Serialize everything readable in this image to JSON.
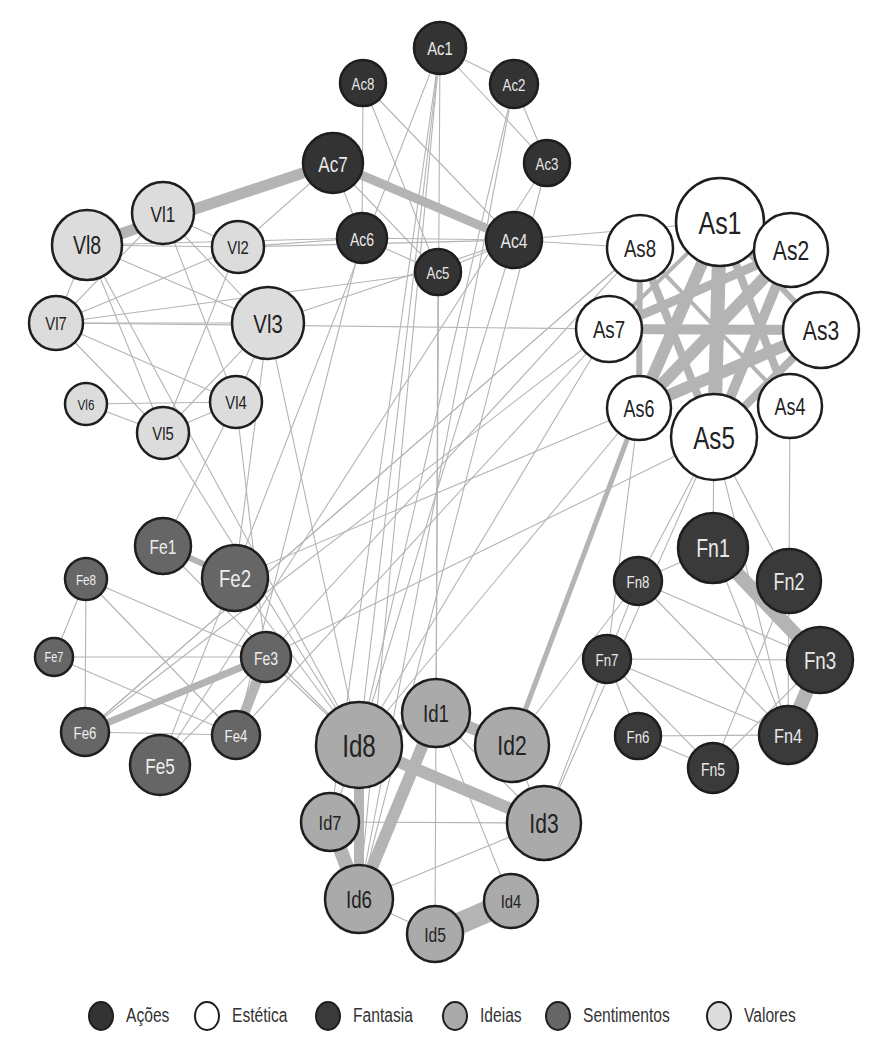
{
  "categories": {
    "Ac": {
      "label": "Ações",
      "fill": "#333333",
      "text": "#e8e8e8"
    },
    "As": {
      "label": "Estética",
      "fill": "#ffffff",
      "text": "#222222"
    },
    "Fn": {
      "label": "Fantasia",
      "fill": "#3a3a3a",
      "text": "#e8e8e8"
    },
    "Id": {
      "label": "Ideias",
      "fill": "#aaaaaa",
      "text": "#222222"
    },
    "Fe": {
      "label": "Sentimentos",
      "fill": "#666666",
      "text": "#eeeeee"
    },
    "Vl": {
      "label": "Valores",
      "fill": "#dcdcdc",
      "text": "#222222"
    }
  },
  "legend": [
    {
      "cat": "Ac",
      "label": "Ações"
    },
    {
      "cat": "As",
      "label": "Estética"
    },
    {
      "cat": "Fn",
      "label": "Fantasia"
    },
    {
      "cat": "Id",
      "label": "Ideias"
    },
    {
      "cat": "Fe",
      "label": "Sentimentos"
    },
    {
      "cat": "Vl",
      "label": "Valores"
    }
  ],
  "nodes": [
    {
      "id": "Ac1",
      "label": "Ac1",
      "cat": "Ac",
      "x": 440,
      "y": 48,
      "r": 26
    },
    {
      "id": "Ac2",
      "label": "Ac2",
      "cat": "Ac",
      "x": 514,
      "y": 84,
      "r": 24
    },
    {
      "id": "Ac3",
      "label": "Ac3",
      "cat": "Ac",
      "x": 547,
      "y": 163,
      "r": 23
    },
    {
      "id": "Ac4",
      "label": "Ac4",
      "cat": "Ac",
      "x": 514,
      "y": 240,
      "r": 28
    },
    {
      "id": "Ac5",
      "label": "Ac5",
      "cat": "Ac",
      "x": 438,
      "y": 272,
      "r": 23
    },
    {
      "id": "Ac6",
      "label": "Ac6",
      "cat": "Ac",
      "x": 362,
      "y": 238,
      "r": 25
    },
    {
      "id": "Ac7",
      "label": "Ac7",
      "cat": "Ac",
      "x": 333,
      "y": 163,
      "r": 30
    },
    {
      "id": "Ac8",
      "label": "Ac8",
      "cat": "Ac",
      "x": 363,
      "y": 83,
      "r": 23
    },
    {
      "id": "As1",
      "label": "As1",
      "cat": "As",
      "x": 720,
      "y": 222,
      "r": 44
    },
    {
      "id": "As2",
      "label": "As2",
      "cat": "As",
      "x": 791,
      "y": 250,
      "r": 37
    },
    {
      "id": "As3",
      "label": "As3",
      "cat": "As",
      "x": 821,
      "y": 330,
      "r": 38
    },
    {
      "id": "As4",
      "label": "As4",
      "cat": "As",
      "x": 790,
      "y": 406,
      "r": 32
    },
    {
      "id": "As5",
      "label": "As5",
      "cat": "As",
      "x": 714,
      "y": 437,
      "r": 43
    },
    {
      "id": "As6",
      "label": "As6",
      "cat": "As",
      "x": 639,
      "y": 408,
      "r": 32
    },
    {
      "id": "As7",
      "label": "As7",
      "cat": "As",
      "x": 609,
      "y": 329,
      "r": 33
    },
    {
      "id": "As8",
      "label": "As8",
      "cat": "As",
      "x": 640,
      "y": 248,
      "r": 33
    },
    {
      "id": "Fn1",
      "label": "Fn1",
      "cat": "Fn",
      "x": 713,
      "y": 548,
      "r": 35
    },
    {
      "id": "Fn2",
      "label": "Fn2",
      "cat": "Fn",
      "x": 789,
      "y": 581,
      "r": 32
    },
    {
      "id": "Fn3",
      "label": "Fn3",
      "cat": "Fn",
      "x": 820,
      "y": 660,
      "r": 33
    },
    {
      "id": "Fn4",
      "label": "Fn4",
      "cat": "Fn",
      "x": 788,
      "y": 735,
      "r": 29
    },
    {
      "id": "Fn5",
      "label": "Fn5",
      "cat": "Fn",
      "x": 713,
      "y": 768,
      "r": 25
    },
    {
      "id": "Fn6",
      "label": "Fn6",
      "cat": "Fn",
      "x": 638,
      "y": 736,
      "r": 23
    },
    {
      "id": "Fn7",
      "label": "Fn7",
      "cat": "Fn",
      "x": 607,
      "y": 659,
      "r": 24
    },
    {
      "id": "Fn8",
      "label": "Fn8",
      "cat": "Fn",
      "x": 638,
      "y": 581,
      "r": 24
    },
    {
      "id": "Id1",
      "label": "Id1",
      "cat": "Id",
      "x": 436,
      "y": 713,
      "r": 34
    },
    {
      "id": "Id2",
      "label": "Id2",
      "cat": "Id",
      "x": 512,
      "y": 745,
      "r": 37
    },
    {
      "id": "Id3",
      "label": "Id3",
      "cat": "Id",
      "x": 544,
      "y": 823,
      "r": 37
    },
    {
      "id": "Id4",
      "label": "Id4",
      "cat": "Id",
      "x": 511,
      "y": 901,
      "r": 27
    },
    {
      "id": "Id5",
      "label": "Id5",
      "cat": "Id",
      "x": 435,
      "y": 934,
      "r": 28
    },
    {
      "id": "Id6",
      "label": "Id6",
      "cat": "Id",
      "x": 359,
      "y": 899,
      "r": 34
    },
    {
      "id": "Id7",
      "label": "Id7",
      "cat": "Id",
      "x": 330,
      "y": 822,
      "r": 29
    },
    {
      "id": "Id8",
      "label": "Id8",
      "cat": "Id",
      "x": 359,
      "y": 745,
      "r": 43
    },
    {
      "id": "Fe1",
      "label": "Fe1",
      "cat": "Fe",
      "x": 163,
      "y": 546,
      "r": 28
    },
    {
      "id": "Fe2",
      "label": "Fe2",
      "cat": "Fe",
      "x": 235,
      "y": 578,
      "r": 33
    },
    {
      "id": "Fe3",
      "label": "Fe3",
      "cat": "Fe",
      "x": 266,
      "y": 657,
      "r": 25
    },
    {
      "id": "Fe4",
      "label": "Fe4",
      "cat": "Fe",
      "x": 236,
      "y": 735,
      "r": 24
    },
    {
      "id": "Fe5",
      "label": "Fe5",
      "cat": "Fe",
      "x": 160,
      "y": 765,
      "r": 30
    },
    {
      "id": "Fe6",
      "label": "Fe6",
      "cat": "Fe",
      "x": 85,
      "y": 732,
      "r": 24
    },
    {
      "id": "Fe7",
      "label": "Fe7",
      "cat": "Fe",
      "x": 54,
      "y": 657,
      "r": 19
    },
    {
      "id": "Fe8",
      "label": "Fe8",
      "cat": "Fe",
      "x": 86,
      "y": 579,
      "r": 21
    },
    {
      "id": "Vl1",
      "label": "Vl1",
      "cat": "Vl",
      "x": 163,
      "y": 213,
      "r": 31
    },
    {
      "id": "Vl2",
      "label": "Vl2",
      "cat": "Vl",
      "x": 238,
      "y": 247,
      "r": 26
    },
    {
      "id": "Vl3",
      "label": "Vl3",
      "cat": "Vl",
      "x": 268,
      "y": 323,
      "r": 36
    },
    {
      "id": "Vl4",
      "label": "Vl4",
      "cat": "Vl",
      "x": 236,
      "y": 402,
      "r": 26
    },
    {
      "id": "Vl5",
      "label": "Vl5",
      "cat": "Vl",
      "x": 163,
      "y": 433,
      "r": 26
    },
    {
      "id": "Vl6",
      "label": "Vl6",
      "cat": "Vl",
      "x": 86,
      "y": 404,
      "r": 21
    },
    {
      "id": "Vl7",
      "label": "Vl7",
      "cat": "Vl",
      "x": 56,
      "y": 323,
      "r": 27
    },
    {
      "id": "Vl8",
      "label": "Vl8",
      "cat": "Vl",
      "x": 87,
      "y": 245,
      "r": 35
    }
  ],
  "edges": [
    [
      "Ac7",
      "Vl8",
      11
    ],
    [
      "Ac7",
      "Ac4",
      9
    ],
    [
      "Ac1",
      "Ac2",
      1
    ],
    [
      "Ac1",
      "Ac3",
      1
    ],
    [
      "Ac2",
      "Ac3",
      1
    ],
    [
      "Ac8",
      "Ac6",
      1
    ],
    [
      "Ac8",
      "Ac5",
      1
    ],
    [
      "Ac8",
      "Ac4",
      1
    ],
    [
      "Ac7",
      "Ac6",
      1
    ],
    [
      "Ac7",
      "Ac5",
      1
    ],
    [
      "Ac6",
      "Ac4",
      1
    ],
    [
      "Ac6",
      "Ac5",
      1
    ],
    [
      "Ac5",
      "Ac4",
      1
    ],
    [
      "Ac4",
      "As1",
      1
    ],
    [
      "Ac4",
      "As8",
      1
    ],
    [
      "Ac6",
      "Vl2",
      1
    ],
    [
      "Ac6",
      "Vl8",
      1
    ],
    [
      "Ac4",
      "Vl2",
      1
    ],
    [
      "Ac7",
      "Vl2",
      1
    ],
    [
      "Ac5",
      "Vl7",
      1
    ],
    [
      "Ac1",
      "Id8",
      1
    ],
    [
      "Ac1",
      "Id6",
      1
    ],
    [
      "Ac1",
      "Id1",
      1
    ],
    [
      "Ac2",
      "Id8",
      1
    ],
    [
      "Ac2",
      "Id6",
      1
    ],
    [
      "Ac3",
      "Id6",
      1
    ],
    [
      "Ac5",
      "Id1",
      1
    ],
    [
      "Ac4",
      "Id8",
      1
    ],
    [
      "Ac1",
      "Id7",
      1
    ],
    [
      "Ac3",
      "Fe5",
      1
    ],
    [
      "Vl1",
      "Vl2",
      1
    ],
    [
      "Vl1",
      "Vl3",
      1
    ],
    [
      "Vl1",
      "Vl4",
      1
    ],
    [
      "Vl1",
      "Vl7",
      1
    ],
    [
      "Vl8",
      "Vl7",
      1
    ],
    [
      "Vl8",
      "Vl2",
      1
    ],
    [
      "Vl8",
      "Vl3",
      1
    ],
    [
      "Vl8",
      "Vl5",
      1
    ],
    [
      "Vl7",
      "Vl2",
      1
    ],
    [
      "Vl7",
      "Vl3",
      1
    ],
    [
      "Vl7",
      "Vl4",
      1
    ],
    [
      "Vl7",
      "Vl5",
      1
    ],
    [
      "Vl6",
      "Vl4",
      1
    ],
    [
      "Vl6",
      "Vl5",
      1
    ],
    [
      "Vl5",
      "Vl4",
      1
    ],
    [
      "Vl5",
      "Vl3",
      1
    ],
    [
      "Vl4",
      "Vl3",
      1
    ],
    [
      "Vl2",
      "Vl5",
      1
    ],
    [
      "Vl7",
      "As7",
      1
    ],
    [
      "Vl3",
      "Ac4",
      1
    ],
    [
      "Vl3",
      "Id8",
      1
    ],
    [
      "Vl3",
      "Fe2",
      1
    ],
    [
      "Vl4",
      "Fe1",
      1
    ],
    [
      "Vl5",
      "Id8",
      1
    ],
    [
      "Vl4",
      "Fe3",
      1
    ],
    [
      "Vl8",
      "Id8",
      1
    ],
    [
      "As1",
      "As5",
      14
    ],
    [
      "As1",
      "As6",
      12
    ],
    [
      "As2",
      "As6",
      12
    ],
    [
      "As2",
      "As5",
      10
    ],
    [
      "As3",
      "As6",
      12
    ],
    [
      "As3",
      "As7",
      10
    ],
    [
      "As1",
      "As4",
      8
    ],
    [
      "As8",
      "As5",
      8
    ],
    [
      "As2",
      "As7",
      9
    ],
    [
      "As1",
      "As3",
      6
    ],
    [
      "As8",
      "As6",
      6
    ],
    [
      "As3",
      "As5",
      8
    ],
    [
      "As1",
      "As7",
      4
    ],
    [
      "As7",
      "As3",
      1
    ],
    [
      "As8",
      "As4",
      4
    ],
    [
      "As6",
      "Id2",
      5
    ],
    [
      "As8",
      "Fe3",
      1
    ],
    [
      "As7",
      "Fe6",
      1
    ],
    [
      "As7",
      "Fe4",
      1
    ],
    [
      "As8",
      "Fe6",
      1
    ],
    [
      "As6",
      "Id8",
      1
    ],
    [
      "As5",
      "Fn1",
      1
    ],
    [
      "As5",
      "Fn8",
      1
    ],
    [
      "As5",
      "Fn2",
      1
    ],
    [
      "As5",
      "Fn4",
      1
    ],
    [
      "As4",
      "Fn2",
      1
    ],
    [
      "As5",
      "Fe3",
      1
    ],
    [
      "As5",
      "Id3",
      1
    ],
    [
      "As6",
      "Fn7",
      1
    ],
    [
      "As7",
      "Id8",
      1
    ],
    [
      "As6",
      "Fe2",
      1
    ],
    [
      "Fn1",
      "Fn3",
      14
    ],
    [
      "Fn3",
      "Fn4",
      14
    ],
    [
      "Fn1",
      "Fn8",
      1
    ],
    [
      "Fn1",
      "Fn4",
      1
    ],
    [
      "Fn2",
      "Fn5",
      1
    ],
    [
      "Fn8",
      "Fn3",
      1
    ],
    [
      "Fn8",
      "Fn4",
      1
    ],
    [
      "Fn8",
      "Fn7",
      1
    ],
    [
      "Fn7",
      "Fn3",
      1
    ],
    [
      "Fn7",
      "Fn4",
      1
    ],
    [
      "Fn7",
      "Fn5",
      1
    ],
    [
      "Fn7",
      "Fn6",
      1
    ],
    [
      "Fn6",
      "Fn4",
      1
    ],
    [
      "Fn6",
      "Fn5",
      1
    ],
    [
      "Fn5",
      "Fn3",
      1
    ],
    [
      "Fn7",
      "Id3",
      1
    ],
    [
      "Fn8",
      "Id2",
      1
    ],
    [
      "Fn2",
      "Fn4",
      1
    ],
    [
      "Id8",
      "Id3",
      12
    ],
    [
      "Id1",
      "Id2",
      12
    ],
    [
      "Id8",
      "Id6",
      10
    ],
    [
      "Id1",
      "Id6",
      12
    ],
    [
      "Id7",
      "Id6",
      14
    ],
    [
      "Id5",
      "Id4",
      22
    ],
    [
      "Id8",
      "Id1",
      6
    ],
    [
      "Id7",
      "Id3",
      1
    ],
    [
      "Id1",
      "Id5",
      1
    ],
    [
      "Id1",
      "Id4",
      1
    ],
    [
      "Id6",
      "Id3",
      1
    ],
    [
      "Id6",
      "Id5",
      1
    ],
    [
      "Id2",
      "Id3",
      1
    ],
    [
      "Id1",
      "Id3",
      1
    ],
    [
      "Id8",
      "Id7",
      1
    ],
    [
      "Fe1",
      "Fe2",
      6
    ],
    [
      "Fe3",
      "Fe6",
      7
    ],
    [
      "Fe3",
      "Fe4",
      10
    ],
    [
      "Fe8",
      "Fe3",
      1
    ],
    [
      "Fe8",
      "Fe4",
      1
    ],
    [
      "Fe8",
      "Fe7",
      1
    ],
    [
      "Fe8",
      "Fe6",
      1
    ],
    [
      "Fe7",
      "Fe3",
      1
    ],
    [
      "Fe7",
      "Fe4",
      1
    ],
    [
      "Fe6",
      "Fe4",
      1
    ],
    [
      "Fe5",
      "Fe3",
      1
    ],
    [
      "Fe2",
      "Id8",
      1
    ],
    [
      "Fe3",
      "Id8",
      1
    ],
    [
      "Fe1",
      "Id8",
      1
    ],
    [
      "Fe6",
      "As8",
      1
    ],
    [
      "Fe4",
      "Ac6",
      1
    ],
    [
      "Fe5",
      "Ac1",
      1
    ]
  ]
}
